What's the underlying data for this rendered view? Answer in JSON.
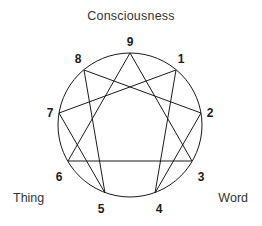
{
  "figure": {
    "kind": "enneagram",
    "title": "Consciousness",
    "left_label": "Thing",
    "right_label": "Word",
    "background_color": "#ffffff",
    "line_color": "#1a1a1a",
    "text_color": "#333333",
    "number_color": "#1c1c1c",
    "circle": {
      "center_x": 130,
      "center_y": 125,
      "radius": 72
    },
    "points": [
      {
        "label": "9",
        "angle_deg": 90,
        "x": 130,
        "y": 53,
        "label_x": 130,
        "label_y": 42
      },
      {
        "label": "1",
        "angle_deg": 50,
        "x": 176,
        "y": 70,
        "label_x": 181,
        "label_y": 59
      },
      {
        "label": "2",
        "angle_deg": 10,
        "x": 201,
        "y": 113,
        "label_x": 210,
        "label_y": 113
      },
      {
        "label": "3",
        "angle_deg": 330,
        "x": 192,
        "y": 161,
        "label_x": 201,
        "label_y": 177
      },
      {
        "label": "4",
        "angle_deg": 290,
        "x": 155,
        "y": 193,
        "label_x": 159,
        "label_y": 209
      },
      {
        "label": "5",
        "angle_deg": 250,
        "x": 105,
        "y": 193,
        "label_x": 101,
        "label_y": 209
      },
      {
        "label": "6",
        "angle_deg": 210,
        "x": 68,
        "y": 161,
        "label_x": 59,
        "label_y": 177
      },
      {
        "label": "7",
        "angle_deg": 170,
        "x": 59,
        "y": 113,
        "label_x": 50,
        "label_y": 113
      },
      {
        "label": "8",
        "angle_deg": 130,
        "x": 84,
        "y": 70,
        "label_x": 78,
        "label_y": 59
      }
    ],
    "triangle_path": [
      "9",
      "3",
      "6",
      "9"
    ],
    "hexad_path": [
      "1",
      "4",
      "2",
      "8",
      "5",
      "7",
      "1"
    ]
  }
}
